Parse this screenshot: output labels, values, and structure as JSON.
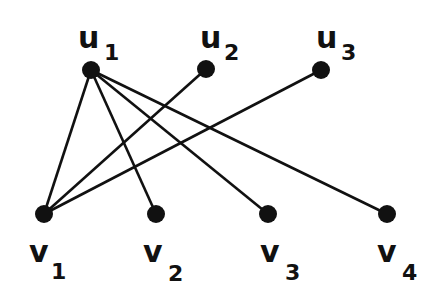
{
  "diagram": {
    "type": "bipartite-graph",
    "colors": {
      "node": "#111111",
      "edge": "#111111",
      "background": "#ffffff"
    },
    "nodes": [
      {
        "id": "u1",
        "letter": "u",
        "index": "1",
        "x": 91,
        "y": 70
      },
      {
        "id": "u2",
        "letter": "u",
        "index": "2",
        "x": 206,
        "y": 69
      },
      {
        "id": "u3",
        "letter": "u",
        "index": "3",
        "x": 321,
        "y": 70
      },
      {
        "id": "v1",
        "letter": "v",
        "index": "1",
        "x": 44,
        "y": 214
      },
      {
        "id": "v2",
        "letter": "v",
        "index": "2",
        "x": 156,
        "y": 214
      },
      {
        "id": "v3",
        "letter": "v",
        "index": "3",
        "x": 268,
        "y": 214
      },
      {
        "id": "v4",
        "letter": "v",
        "index": "4",
        "x": 387,
        "y": 214
      }
    ],
    "edges": [
      {
        "from": "u1",
        "to": "v1"
      },
      {
        "from": "u1",
        "to": "v2"
      },
      {
        "from": "u1",
        "to": "v3"
      },
      {
        "from": "u1",
        "to": "v4"
      },
      {
        "from": "u2",
        "to": "v1"
      },
      {
        "from": "u3",
        "to": "v1"
      }
    ]
  }
}
